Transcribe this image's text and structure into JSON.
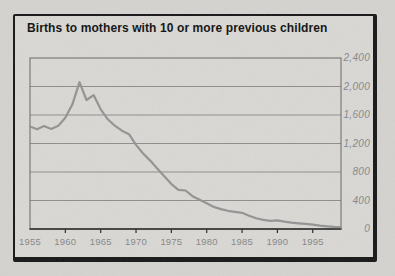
{
  "chart_data": {
    "type": "line",
    "title": "Births to mothers with 10 or more previous children",
    "xlabel": "",
    "ylabel": "",
    "x": [
      1955,
      1956,
      1957,
      1958,
      1959,
      1960,
      1961,
      1962,
      1963,
      1964,
      1965,
      1966,
      1967,
      1968,
      1969,
      1970,
      1971,
      1972,
      1973,
      1974,
      1975,
      1976,
      1977,
      1978,
      1979,
      1980,
      1981,
      1982,
      1983,
      1984,
      1985,
      1986,
      1987,
      1988,
      1989,
      1990,
      1991,
      1992,
      1993,
      1994,
      1995,
      1996,
      1997,
      1998,
      1999
    ],
    "values": [
      1440,
      1400,
      1445,
      1405,
      1450,
      1560,
      1750,
      2060,
      1810,
      1880,
      1680,
      1540,
      1450,
      1380,
      1330,
      1180,
      1060,
      960,
      850,
      740,
      630,
      550,
      540,
      460,
      410,
      360,
      310,
      280,
      255,
      240,
      228,
      185,
      150,
      128,
      115,
      120,
      103,
      90,
      80,
      72,
      62,
      48,
      38,
      30,
      26
    ],
    "xlim": [
      1955,
      1999
    ],
    "ylim": [
      0,
      2400
    ],
    "xticks": [
      1955,
      1960,
      1965,
      1970,
      1975,
      1980,
      1985,
      1990,
      1995
    ],
    "xtick_labels": [
      "1955",
      "1960",
      "1965",
      "1970",
      "1975",
      "1980",
      "1985",
      "1990",
      "1995"
    ],
    "yticks": [
      0,
      400,
      800,
      1200,
      1600,
      2000,
      2400
    ],
    "ytick_labels": [
      "0",
      "400",
      "800",
      "1,200",
      "1,600",
      "2,000",
      "2,400"
    ],
    "grid": "horizontal",
    "legend": "none",
    "y_axis_side": "right",
    "colors": {
      "page": "#d4d3d0",
      "card": "#d9d8d4",
      "border": "#161616",
      "grid": "#8d8d8d",
      "frame": "#67675f",
      "axis": "#262626",
      "line": "#939393",
      "label": "#87878b",
      "title": "#101010"
    }
  }
}
